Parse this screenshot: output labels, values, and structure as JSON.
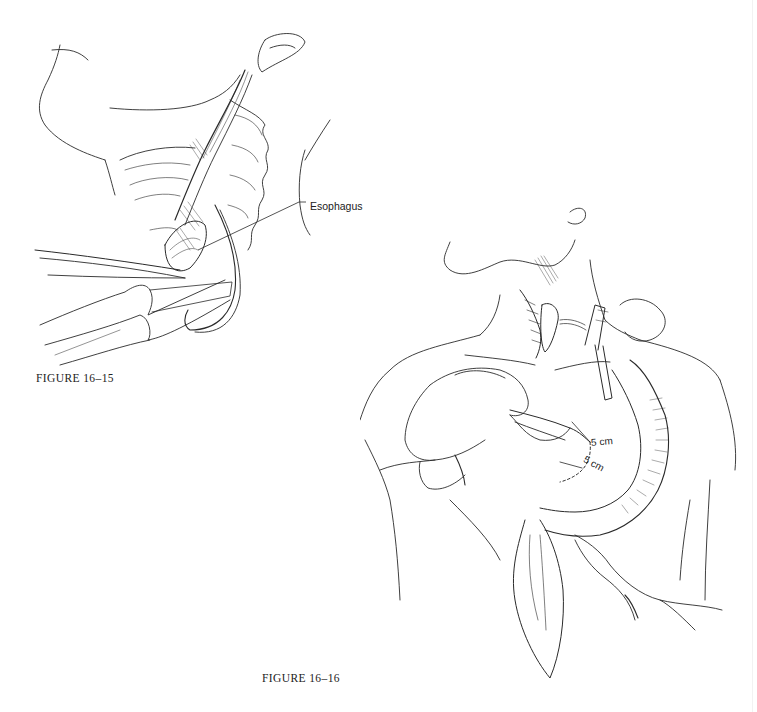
{
  "figures": [
    {
      "id": "16-15",
      "caption": "FIGURE 16–15",
      "labels": [
        {
          "text": "Esophagus",
          "target": "esophagus"
        }
      ]
    },
    {
      "id": "16-16",
      "caption": "FIGURE 16–16",
      "measurements": [
        {
          "text": "5 cm"
        },
        {
          "text": "5 cm"
        }
      ]
    }
  ],
  "colors": {
    "line": "#2a2a2a",
    "background": "#ffffff"
  }
}
